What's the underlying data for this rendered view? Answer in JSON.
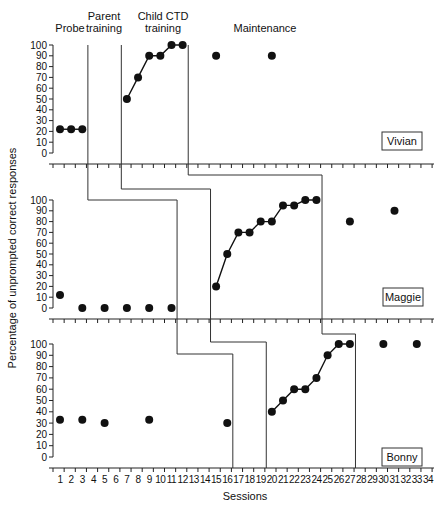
{
  "chart_data": {
    "type": "line",
    "title": "",
    "xlabel": "Sessions",
    "ylabel": "Percentage of unprompted correct responses",
    "x_ticks": [
      1,
      2,
      3,
      4,
      5,
      6,
      7,
      8,
      9,
      10,
      11,
      12,
      13,
      14,
      15,
      16,
      17,
      18,
      19,
      20,
      21,
      22,
      23,
      24,
      25,
      26,
      27,
      28,
      29,
      30,
      31,
      32,
      33,
      34
    ],
    "y_ticks": [
      0,
      10,
      20,
      30,
      40,
      50,
      60,
      70,
      80,
      90,
      100
    ],
    "ylim": [
      0,
      100
    ],
    "xlim": [
      1,
      34
    ],
    "grid": false,
    "phase_labels": [
      "Probe",
      "Parent training",
      "Child CTD training",
      "Maintenance"
    ],
    "panels": [
      {
        "participant": "Vivian",
        "series": [
          {
            "phase": "Probe",
            "x": [
              1,
              2,
              3
            ],
            "y": [
              22,
              22,
              22
            ],
            "connected": true
          },
          {
            "phase": "Child CTD training",
            "x": [
              7,
              8,
              9,
              10,
              11,
              12
            ],
            "y": [
              50,
              70,
              90,
              90,
              100,
              100
            ],
            "connected": true
          },
          {
            "phase": "Maintenance",
            "x": [
              15,
              20
            ],
            "y": [
              90,
              90
            ],
            "connected": false
          }
        ],
        "phase_changes_after": [
          3,
          6,
          12
        ]
      },
      {
        "participant": "Maggie",
        "series": [
          {
            "phase": "Probe",
            "x": [
              1,
              3,
              5,
              7,
              9,
              11
            ],
            "y": [
              12,
              0,
              0,
              0,
              0,
              0
            ],
            "connected": false
          },
          {
            "phase": "Child CTD training",
            "x": [
              15,
              16,
              17,
              18,
              19,
              20,
              21,
              22,
              23,
              24
            ],
            "y": [
              20,
              50,
              70,
              70,
              80,
              80,
              95,
              95,
              100,
              100
            ],
            "connected": true
          },
          {
            "phase": "Maintenance",
            "x": [
              27,
              31
            ],
            "y": [
              80,
              90
            ],
            "connected": false
          }
        ],
        "phase_changes_after": [
          11,
          14,
          24
        ]
      },
      {
        "participant": "Bonny",
        "series": [
          {
            "phase": "Probe",
            "x": [
              1,
              3,
              5,
              9,
              16
            ],
            "y": [
              33,
              33,
              30,
              33,
              30
            ],
            "connected": false
          },
          {
            "phase": "Child CTD training",
            "x": [
              20,
              21,
              22,
              23,
              24,
              25,
              26,
              27
            ],
            "y": [
              40,
              50,
              60,
              60,
              70,
              90,
              100,
              100
            ],
            "connected": true
          },
          {
            "phase": "Maintenance",
            "x": [
              30,
              33
            ],
            "y": [
              100,
              100
            ],
            "connected": false
          }
        ],
        "phase_changes_after": [
          16,
          19,
          27
        ]
      }
    ]
  }
}
